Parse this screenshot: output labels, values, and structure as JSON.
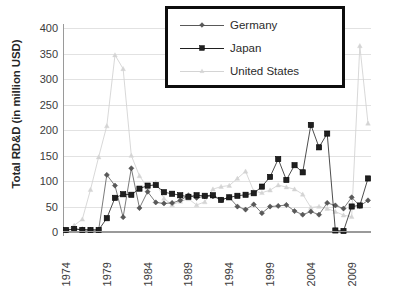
{
  "chart_data": {
    "type": "line",
    "title": "",
    "xlabel": "",
    "ylabel": "Total RD&D (in million USD)",
    "ylim": [
      0,
      400
    ],
    "ytick_values": [
      400,
      350,
      300,
      250,
      200,
      150,
      100,
      50,
      0
    ],
    "ytick_labels": [
      "400",
      "350",
      "300",
      "250",
      "200",
      "150",
      "100",
      "50",
      "0"
    ],
    "xlim": [
      1974,
      2011
    ],
    "x": [
      1974,
      1975,
      1976,
      1977,
      1978,
      1979,
      1980,
      1981,
      1982,
      1983,
      1984,
      1985,
      1986,
      1987,
      1988,
      1989,
      1990,
      1991,
      1992,
      1993,
      1994,
      1995,
      1996,
      1997,
      1998,
      1999,
      2000,
      2001,
      2002,
      2003,
      2004,
      2005,
      2006,
      2007,
      2008,
      2009,
      2010,
      2011
    ],
    "xtick_labels": [
      "1974",
      "1979",
      "1984",
      "1989",
      "1994",
      "1999",
      "2004",
      "2009"
    ],
    "xtick_values": [
      1974,
      1979,
      1984,
      1989,
      1994,
      1999,
      2004,
      2009
    ],
    "grid": "horizontal",
    "legend_position": "top-center",
    "series": [
      {
        "name": "Germany",
        "color": "#595959",
        "marker": "diamond",
        "values": [
          3,
          6,
          5,
          4,
          4,
          112,
          91,
          29,
          125,
          47,
          79,
          58,
          56,
          57,
          62,
          72,
          67,
          70,
          70,
          63,
          68,
          50,
          44,
          54,
          37,
          50,
          51,
          53,
          41,
          34,
          40,
          34,
          57,
          52,
          46,
          68,
          51,
          62
        ]
      },
      {
        "name": "Japan",
        "color": "#1f1f1f",
        "marker": "square",
        "values": [
          4,
          6,
          4,
          4,
          4,
          27,
          67,
          74,
          73,
          85,
          91,
          92,
          78,
          75,
          72,
          69,
          72,
          71,
          72,
          63,
          68,
          71,
          73,
          76,
          89,
          108,
          143,
          102,
          131,
          117,
          210,
          166,
          193,
          3,
          2,
          50,
          52,
          105
        ]
      },
      {
        "name": "United States",
        "color": "#d4d4d4",
        "marker": "triangle",
        "values": [
          4,
          13,
          25,
          83,
          147,
          208,
          347,
          320,
          150,
          110,
          87,
          97,
          66,
          53,
          60,
          65,
          53,
          59,
          84,
          89,
          91,
          105,
          119,
          80,
          77,
          82,
          92,
          88,
          84,
          74,
          48,
          50,
          46,
          40,
          33,
          30,
          365,
          213
        ]
      }
    ]
  },
  "legend": {
    "entries": [
      {
        "label": "Germany"
      },
      {
        "label": "Japan"
      },
      {
        "label": "United States"
      }
    ]
  }
}
